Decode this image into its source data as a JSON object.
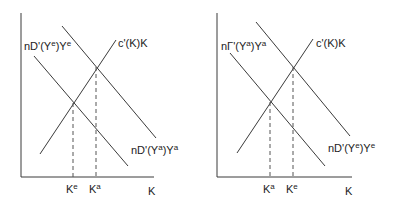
{
  "panels": [
    {
      "name": "left",
      "demand_lower_label": {
        "pre": "nD'(Y",
        "sup1": "e",
        "mid": ")Y",
        "sup2": "e"
      },
      "demand_upper_label": {
        "pre": "nD'(Y",
        "sup1": "a",
        "mid": ")Y",
        "sup2": "a"
      },
      "cost_label": "c'(K)K",
      "tick_left": {
        "base": "K",
        "sup": "e"
      },
      "tick_right": {
        "base": "K",
        "sup": "a"
      },
      "x_axis_label": "K"
    },
    {
      "name": "right",
      "demand_lower_label": {
        "pre": "nΓ'(Y",
        "sup1": "a",
        "mid": ")Y",
        "sup2": "a"
      },
      "demand_upper_label": {
        "pre": "nD'(Y",
        "sup1": "e",
        "mid": ")Y",
        "sup2": "e"
      },
      "cost_label": "c'(K)K",
      "tick_left": {
        "base": "K",
        "sup": "a"
      },
      "tick_right": {
        "base": "K",
        "sup": "e"
      },
      "x_axis_label": "K"
    }
  ],
  "colors": {
    "line": "#3a3a3a",
    "dash": "#555555"
  }
}
